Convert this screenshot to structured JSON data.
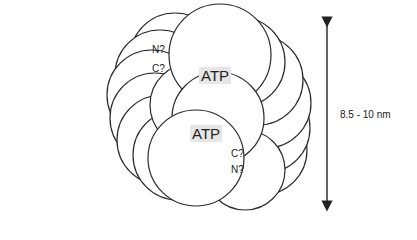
{
  "diagram": {
    "atp_labels": [
      "ATP",
      "ATP"
    ],
    "terminus_labels": {
      "upper_n": "N?",
      "upper_c": "C?",
      "lower_c": "C?",
      "lower_n": "N?"
    },
    "dimension": {
      "label": "8.5 - 10 nm"
    },
    "colors": {
      "stroke": "#2a2a2a",
      "fill": "#ffffff",
      "atp_bg": "#e6e6e6"
    }
  }
}
